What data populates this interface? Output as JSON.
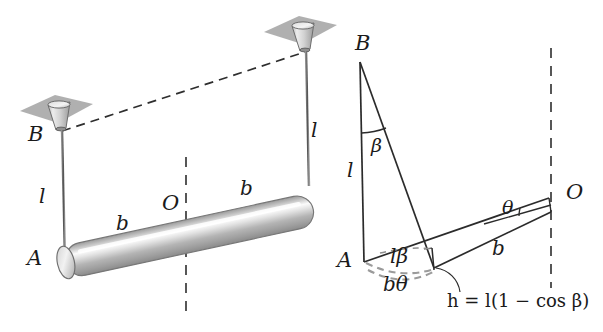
{
  "figure": {
    "colors": {
      "ink": "#1a1a1a",
      "dashed": "#3a3a3a",
      "plate_fill": "#a9a9a9",
      "cone_light": "#e4e4e4",
      "cone_mid": "#bdbdbd",
      "cone_dark": "#949494",
      "rod_highlight": "#fdfdfd",
      "rod_mid": "#c9c9c9",
      "rod_dark": "#8e8e8e",
      "background": "#ffffff"
    }
  },
  "left_diagram": {
    "name": "rest-configuration",
    "labels": {
      "point_b": "B",
      "point_a": "A",
      "point_o": "O",
      "wire_left_length": "l",
      "wire_right_length": "l",
      "half_span_left": "b",
      "half_span_right": "b"
    }
  },
  "right_diagram": {
    "name": "displaced-configuration",
    "labels": {
      "point_b": "B",
      "point_a": "A",
      "point_o": "O",
      "wire_length": "l",
      "angle_beta": "β",
      "angle_theta": "θ",
      "arc_l_beta": "lβ",
      "arc_b_theta": "bθ",
      "radius_b": "b",
      "height_formula": "h = l(1 − cos β)"
    }
  }
}
